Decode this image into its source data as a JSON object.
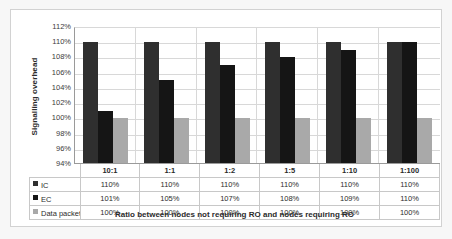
{
  "chart_data": {
    "type": "bar",
    "title": "",
    "subtitle": "",
    "xlabel": "Ratio between nodes not requiring RO and nodes requiring RO",
    "ylabel": "Signalling overhead",
    "categories": [
      "10:1",
      "1:1",
      "1:2",
      "1:5",
      "1:10",
      "1:100"
    ],
    "series": [
      {
        "name": "IC",
        "color": "#2f2f2f",
        "values": [
          110,
          110,
          110,
          110,
          110,
          110
        ],
        "value_labels": [
          "110%",
          "110%",
          "110%",
          "110%",
          "110%",
          "110%"
        ]
      },
      {
        "name": "EC",
        "color": "#151515",
        "values": [
          101,
          105,
          107,
          108,
          109,
          110
        ],
        "value_labels": [
          "101%",
          "105%",
          "107%",
          "108%",
          "109%",
          "110%"
        ]
      },
      {
        "name": "Data packets",
        "color": "#a9a9a9",
        "values": [
          100,
          100,
          100,
          100,
          100,
          100
        ],
        "value_labels": [
          "100%",
          "100%",
          "100%",
          "100%",
          "100%",
          "100%"
        ]
      }
    ],
    "ylim": [
      94,
      112
    ],
    "ytick_step": 2,
    "ytick_labels": [
      "112%",
      "110%",
      "108%",
      "106%",
      "104%",
      "102%",
      "100%",
      "98%",
      "96%",
      "94%"
    ],
    "ytick_values": [
      112,
      110,
      108,
      106,
      104,
      102,
      100,
      98,
      96,
      94
    ],
    "grid": true,
    "legend_position": "data-table-left",
    "unit": "%"
  },
  "table": {
    "header_label": "",
    "rows": [
      {
        "label": "IC",
        "swatch": "ic-swatch-icon",
        "values": [
          "110%",
          "110%",
          "110%",
          "110%",
          "110%",
          "110%"
        ]
      },
      {
        "label": "EC",
        "swatch": "ec-swatch-icon",
        "values": [
          "101%",
          "105%",
          "107%",
          "108%",
          "109%",
          "110%"
        ]
      },
      {
        "label": "Data packets",
        "swatch": "data-packets-swatch-icon",
        "values": [
          "100%",
          "100%",
          "100%",
          "100%",
          "100%",
          "100%"
        ]
      }
    ]
  },
  "colors": {
    "ic": "#2f2f2f",
    "ec": "#151515",
    "data_packets": "#a9a9a9",
    "gridline": "#d8d8d8",
    "axis": "#9a9a9a",
    "frame": "#d2d2d2",
    "page_background": "#f7f7f7",
    "plot_background": "#ffffff"
  }
}
